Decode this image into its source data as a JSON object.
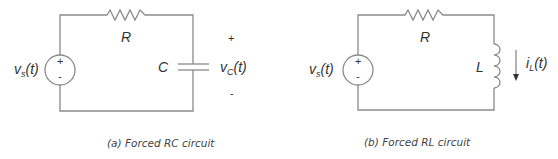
{
  "circuits": [
    {
      "id": "rc",
      "caption": "(a)  Forced RC circuit",
      "source_label": "v",
      "source_sub": "s",
      "source_arg": "(t)",
      "source_plus": "+",
      "source_minus": "-",
      "resistor_label": "R",
      "element_label": "C",
      "output_label": "v",
      "output_sub": "C",
      "output_arg": "(t)",
      "output_plus": "+",
      "output_minus": "-"
    },
    {
      "id": "rl",
      "caption": "(b) Forced RL circuit",
      "source_label": "v",
      "source_sub": "s",
      "source_arg": "(t)",
      "source_plus": "+",
      "source_minus": "-",
      "resistor_label": "R",
      "element_label": "L",
      "output_label": "i",
      "output_sub": "L",
      "output_arg": "(t)"
    }
  ],
  "colors": {
    "wire": "#8a8a8a",
    "text": "#333333"
  }
}
